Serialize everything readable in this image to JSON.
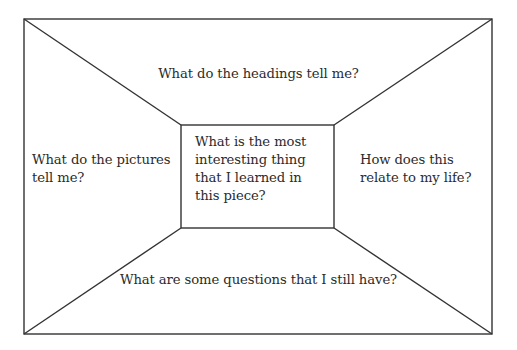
{
  "diagram": {
    "type": "reading-frame-organizer",
    "outer_box": {
      "x1": 24,
      "y1": 19,
      "x2": 492,
      "y2": 334
    },
    "inner_box": {
      "x1": 181,
      "y1": 125,
      "x2": 334,
      "y2": 228
    },
    "stroke_color": "#333333",
    "prompts": {
      "top": "What do the headings tell me?",
      "left": "What do the pictures\ntell me?",
      "center": "What is the most\ninteresting thing\nthat I learned in\nthis piece?",
      "right": "How does this\nrelate to my life?",
      "bottom": "What are some questions that I still have?"
    }
  }
}
